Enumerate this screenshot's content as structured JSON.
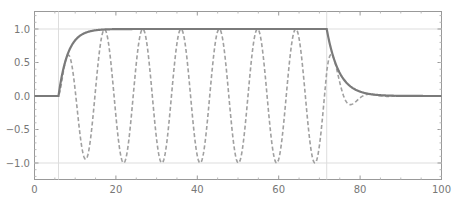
{
  "chart_data": {
    "type": "line",
    "title": "",
    "xlabel": "",
    "ylabel": "",
    "xlim": [
      0,
      100
    ],
    "ylim": [
      -1.25,
      1.25
    ],
    "x_ticks": [
      "0",
      "20",
      "40",
      "60",
      "80",
      "100"
    ],
    "y_ticks": [
      "-1.0",
      "-0.5",
      "0.0",
      "0.5",
      "1.0"
    ],
    "grid": {
      "vertical_lines_x": [
        5.9,
        71.8
      ],
      "horizontal_lines_y": [
        -1.0,
        1.0
      ]
    },
    "legend": null,
    "series": [
      {
        "name": "envelope",
        "style": "solid",
        "color": "#7a7a7a",
        "description": "0 until t≈5.9, rises smoothly to 1.0 by t≈15, flat at 1.0 until t≈71.8, decays smoothly back to 0 by t≈82, then 0 to t=100",
        "x": [
          0,
          5.9,
          8,
          10,
          12,
          14,
          16,
          20,
          40,
          60,
          71.8,
          74,
          76,
          78,
          80,
          82,
          90,
          100
        ],
        "values": [
          0,
          0,
          0.5,
          0.78,
          0.92,
          0.98,
          1.0,
          1.0,
          1.0,
          1.0,
          1.0,
          0.6,
          0.33,
          0.15,
          0.05,
          0.0,
          0.0,
          0.0
        ]
      },
      {
        "name": "oscillation",
        "style": "dashed",
        "color": "#a0a0a0",
        "description": "envelope × cos-like oscillation with period ≈ 9.4; peaks near t≈17,27,36,45,55,64; troughs reach -1.0 near t≈13,22,31,41,50,59,69; damped bump near t≈73 (+0.7) and dip near t≈77 (-0.12)",
        "x": [
          0,
          5.9,
          8,
          13,
          17.2,
          22,
          26.6,
          31,
          36,
          41,
          45.4,
          50,
          54.8,
          59,
          64.2,
          69,
          73,
          77,
          82,
          100
        ],
        "values": [
          0,
          0,
          0.45,
          -0.95,
          1.0,
          -1.0,
          1.0,
          -1.0,
          1.0,
          -1.0,
          1.0,
          -1.0,
          1.0,
          -1.0,
          1.0,
          -1.0,
          0.7,
          -0.12,
          0.0,
          0.0
        ]
      }
    ]
  }
}
